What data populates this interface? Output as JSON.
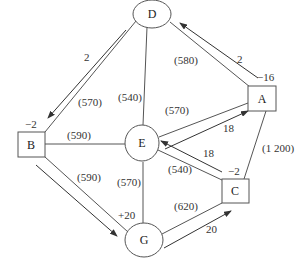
{
  "diagram": {
    "type": "network-flow",
    "colors": {
      "line": "#555555",
      "text": "#333333",
      "background": "#ffffff"
    },
    "nodes": [
      {
        "id": "D",
        "label": "D",
        "shape": "ellipse",
        "supply": ""
      },
      {
        "id": "A",
        "label": "A",
        "shape": "rect",
        "supply": "−16"
      },
      {
        "id": "B",
        "label": "B",
        "shape": "rect",
        "supply": "−2"
      },
      {
        "id": "E",
        "label": "E",
        "shape": "ellipse",
        "supply": ""
      },
      {
        "id": "C",
        "label": "C",
        "shape": "rect",
        "supply": "−2"
      },
      {
        "id": "G",
        "label": "G",
        "shape": "ellipse",
        "supply": "+20"
      }
    ],
    "edges": [
      {
        "from": "D",
        "to": "B",
        "cost": "(570)"
      },
      {
        "from": "D",
        "to": "A",
        "cost": "(580)"
      },
      {
        "from": "D",
        "to": "E",
        "cost": "(540)"
      },
      {
        "from": "B",
        "to": "E",
        "cost": "(590)"
      },
      {
        "from": "B",
        "to": "G",
        "cost": "(590)"
      },
      {
        "from": "E",
        "to": "A",
        "cost": "(570)"
      },
      {
        "from": "E",
        "to": "C",
        "cost": "(540)"
      },
      {
        "from": "E",
        "to": "G",
        "cost": "(570)"
      },
      {
        "from": "G",
        "to": "C",
        "cost": "(620)"
      },
      {
        "from": "A",
        "to": "C",
        "cost": "(1 200)"
      }
    ],
    "flows": [
      {
        "from": "D",
        "to": "B",
        "value": "2"
      },
      {
        "from": "A",
        "to": "D",
        "value": "2"
      },
      {
        "from": "E",
        "to": "A",
        "value": "18"
      },
      {
        "from": "C",
        "to": "E",
        "value": "18"
      },
      {
        "from": "B",
        "to": "G",
        "value": ""
      },
      {
        "from": "G",
        "to": "C",
        "value": "20"
      }
    ]
  }
}
